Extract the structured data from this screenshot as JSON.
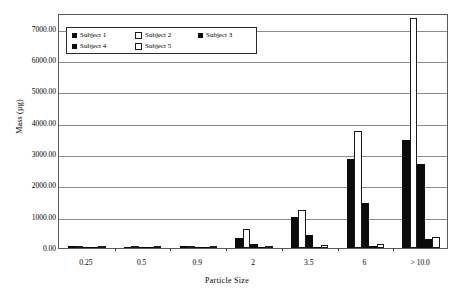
{
  "chart_data": {
    "type": "bar",
    "title": "",
    "subtitle": "",
    "xlabel": "Particle Size",
    "ylabel": "Mass (µg)",
    "categories": [
      "0.25",
      "0.5",
      "0.9",
      "2",
      "3.5",
      "6",
      "> 10.0"
    ],
    "ylim": [
      0,
      7500
    ],
    "ytick_values": [
      0,
      1000,
      2000,
      3000,
      4000,
      5000,
      6000,
      7000
    ],
    "ytick_labels": [
      "0.00",
      "1000.00",
      "2000.00",
      "3000.00",
      "4000.00",
      "5000.00",
      "6000.00",
      "7000.00"
    ],
    "grid": "horizontal",
    "legend_position": "upper-left-inside",
    "series": [
      {
        "name": "Subject 1",
        "fill": "filled",
        "color": "#0b0b0b",
        "values": [
          55,
          12,
          55,
          320,
          1000,
          2840,
          3460
        ]
      },
      {
        "name": "Subject 2",
        "fill": "open",
        "color": "#ffffff",
        "values": [
          80,
          18,
          75,
          620,
          1220,
          3720,
          7330
        ]
      },
      {
        "name": "Subject 3",
        "fill": "filled",
        "color": "#0b0b0b",
        "values": [
          10,
          10,
          25,
          140,
          400,
          1450,
          2690
        ]
      },
      {
        "name": "Subject 4",
        "fill": "filled",
        "color": "#0b0b0b",
        "values": [
          8,
          8,
          12,
          20,
          30,
          80,
          290
        ]
      },
      {
        "name": "Subject 5",
        "fill": "open",
        "color": "#ffffff",
        "values": [
          8,
          8,
          10,
          18,
          90,
          135,
          350
        ]
      }
    ]
  },
  "legend": {
    "rows": [
      [
        {
          "label": "Subject 1",
          "fill": "filled"
        },
        {
          "label": "Subject 2",
          "fill": "open"
        },
        {
          "label": "Subject 3",
          "fill": "filled"
        }
      ],
      [
        {
          "label": "Subject 4",
          "fill": "filled"
        },
        {
          "label": "Subject 5",
          "fill": "open"
        }
      ]
    ]
  }
}
